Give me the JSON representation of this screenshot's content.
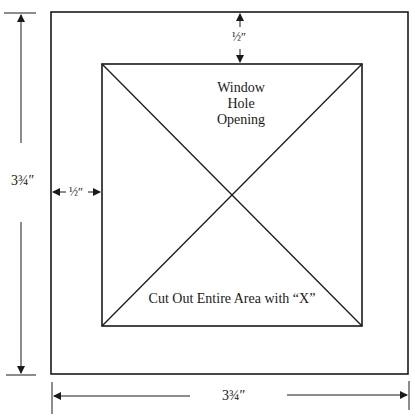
{
  "diagram": {
    "type": "template-dimension-drawing",
    "colors": {
      "line": "#1a1a1a",
      "background": "#ffffff"
    },
    "outer_square": {
      "x": 51,
      "y": 12,
      "w": 357,
      "h": 362
    },
    "inner_square": {
      "x": 102,
      "y": 64,
      "w": 260,
      "h": 262
    },
    "labels": {
      "window_line1": "Window",
      "window_line2": "Hole",
      "window_line3": "Opening",
      "cut_out": "Cut Out Entire Area with “X”",
      "top_margin": "½″",
      "left_margin": "½″",
      "height_dim": "3¾″",
      "width_dim": "3¾″"
    }
  }
}
